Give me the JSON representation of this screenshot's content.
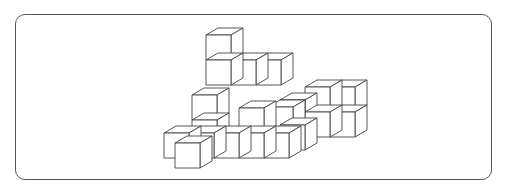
{
  "figure": {
    "colors": {
      "stroke": "#444444",
      "fill": "#ffffff",
      "frame": "#555555"
    },
    "cube_size": 25,
    "depth_offset": {
      "dx": 12,
      "dy": -7
    },
    "cubes": [
      {
        "x": 206,
        "y": 60
      },
      {
        "x": 206,
        "y": 35
      },
      {
        "x": 231,
        "y": 60
      },
      {
        "x": 256,
        "y": 60
      },
      {
        "x": 330,
        "y": 87
      },
      {
        "x": 330,
        "y": 112
      },
      {
        "x": 305,
        "y": 87
      },
      {
        "x": 305,
        "y": 112
      },
      {
        "x": 192,
        "y": 120
      },
      {
        "x": 192,
        "y": 95
      },
      {
        "x": 280,
        "y": 100
      },
      {
        "x": 268,
        "y": 107
      },
      {
        "x": 280,
        "y": 125
      },
      {
        "x": 164,
        "y": 133
      },
      {
        "x": 189,
        "y": 133
      },
      {
        "x": 214,
        "y": 133
      },
      {
        "x": 239,
        "y": 133
      },
      {
        "x": 239,
        "y": 108
      },
      {
        "x": 264,
        "y": 133
      },
      {
        "x": 175,
        "y": 143
      }
    ]
  }
}
